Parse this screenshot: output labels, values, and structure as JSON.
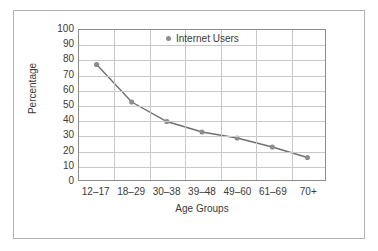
{
  "chart_data": {
    "type": "line",
    "title": "",
    "subtitle": "",
    "xlabel": "Age Groups",
    "ylabel": "Percentage",
    "categories": [
      "12–17",
      "18–29",
      "30–38",
      "39–48",
      "49–60",
      "61–69",
      "70+"
    ],
    "series": [
      {
        "name": "Internet Users",
        "values": [
          77,
          52,
          39,
          32,
          28,
          22,
          15
        ],
        "color": "#6f6f6f",
        "marker": "circle",
        "marker_color": "#8d8d8d"
      }
    ],
    "ylim": [
      0,
      100
    ],
    "yticks": [
      0,
      10,
      20,
      30,
      40,
      50,
      60,
      70,
      80,
      90,
      100
    ],
    "ytick_labels": [
      "0",
      "10",
      "20",
      "30",
      "40",
      "50",
      "60",
      "70",
      "80",
      "90",
      "100"
    ],
    "grid": true,
    "grid_color": "#c8c8c8",
    "legend_position": "top-right",
    "legend_entries": [
      "Internet Users"
    ],
    "axis_color": "#8c8c8c",
    "frame_border_color": "#b2b2b2",
    "background_color": "#ffffff",
    "text_color": "#3a3a3a"
  },
  "legend": {
    "entry_label": "Internet Users",
    "marker_icon": "legend-dot-icon"
  },
  "axes": {
    "x_title": "Age Groups",
    "y_title": "Percentage"
  }
}
